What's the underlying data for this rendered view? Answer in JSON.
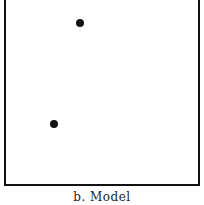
{
  "figure": {
    "caption": "b.  Model",
    "points": [
      {
        "x": 80,
        "y": 23
      },
      {
        "x": 54,
        "y": 124
      }
    ],
    "colors": {
      "stroke": "#111111",
      "background": "#ffffff"
    }
  }
}
